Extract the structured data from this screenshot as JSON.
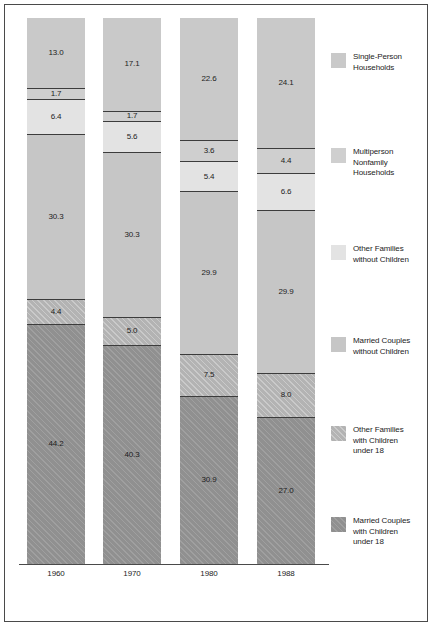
{
  "chart_data": {
    "type": "bar",
    "subtype": "stacked-100-percent-vertical",
    "title": "",
    "xlabel": "",
    "ylabel": "",
    "ylim": [
      0,
      100
    ],
    "grid": false,
    "legend_position": "right",
    "categories": [
      "1960",
      "1970",
      "1980",
      "1988"
    ],
    "stack_order_top_to_bottom": [
      "Single-Person Households",
      "Multiperson Nonfamily Households",
      "Other Families without Children",
      "Married Couples without Children",
      "Other Families with Children under 18",
      "Married Couples with Children under 18"
    ],
    "series": [
      {
        "name": "Single-Person Households",
        "color": "#c9c9c9",
        "values": [
          13.0,
          17.1,
          22.6,
          24.1
        ],
        "labels": [
          "13.0",
          "17.1",
          "22.6",
          "24.1"
        ]
      },
      {
        "name": "Multiperson Nonfamily Households",
        "color": "#cfcfcf",
        "values": [
          1.7,
          1.7,
          3.6,
          4.4
        ],
        "labels": [
          "1.7",
          "1.7",
          "3.6",
          "4.4"
        ]
      },
      {
        "name": "Other Families without Children",
        "color": "#e3e3e3",
        "values": [
          6.4,
          5.6,
          5.4,
          6.6
        ],
        "labels": [
          "6.4",
          "5.6",
          "5.4",
          "6.6"
        ]
      },
      {
        "name": "Married Couples without Children",
        "color": "#c6c6c6",
        "values": [
          30.3,
          30.3,
          29.9,
          29.9
        ],
        "labels": [
          "30.3",
          "30.3",
          "29.9",
          "29.9"
        ]
      },
      {
        "name": "Other Families with Children under 18",
        "color": "#b3b3b3",
        "values": [
          4.4,
          5.0,
          7.5,
          8.0
        ],
        "labels": [
          "4.4",
          "5.0",
          "7.5",
          "8.0"
        ]
      },
      {
        "name": "Married Couples with Children under 18",
        "color": "#909090",
        "values": [
          44.2,
          40.3,
          30.9,
          27.0
        ],
        "labels": [
          "44.2",
          "40.3",
          "30.9",
          "27.0"
        ]
      }
    ]
  },
  "legend": {
    "items": [
      {
        "label": "Single-Person\nHouseholds",
        "color": "#c9c9c9"
      },
      {
        "label": "Multiperson\nNonfamily\nHouseholds",
        "color": "#cfcfcf"
      },
      {
        "label": "Other Families\nwithout Children",
        "color": "#e3e3e3"
      },
      {
        "label": "Married Couples\nwithout Children",
        "color": "#c6c6c6"
      },
      {
        "label": "Other Families\nwith Children\nunder 18",
        "color": "#b3b3b3"
      },
      {
        "label": "Married Couples\nwith Children\nunder 18",
        "color": "#909090"
      }
    ]
  },
  "axis": {
    "tick_labels": [
      "1960",
      "1970",
      "1980",
      "1988"
    ]
  }
}
